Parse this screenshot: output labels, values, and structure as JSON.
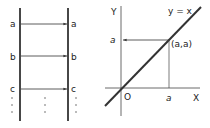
{
  "left_diagram": {
    "title": "identity mapping between two sets",
    "rows": [
      {
        "left": "a",
        "right": "a"
      },
      {
        "left": "b",
        "right": "b"
      },
      {
        "left": "c",
        "right": "c"
      }
    ],
    "continuation": "⋮"
  },
  "right_diagram": {
    "y_axis_label": "Y",
    "x_axis_label": "X",
    "origin_label": "O",
    "line_label": "y = x",
    "point_label": "(a,a)",
    "x_tick_label": "a",
    "y_tick_label": "a"
  },
  "colors": {
    "stroke": "#333333",
    "background": "#ffffff"
  }
}
